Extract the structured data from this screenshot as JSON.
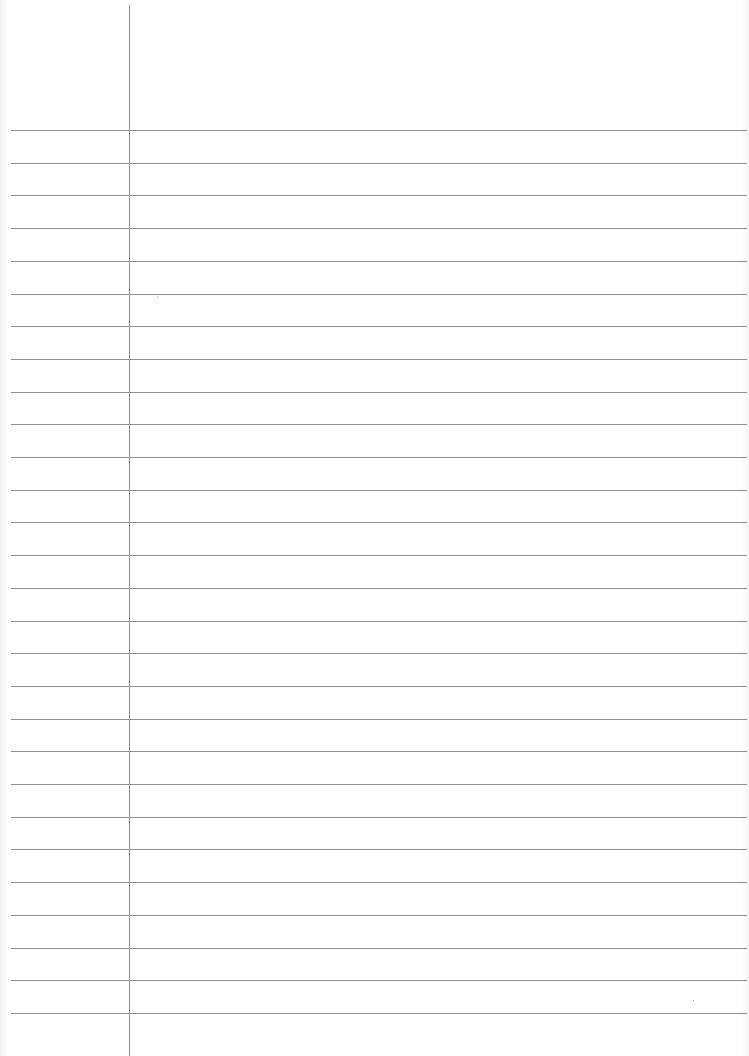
{
  "page": {
    "type": "ruled notebook sheet",
    "text": "",
    "colors": {
      "paper": "#ffffff",
      "rule": "#8f8f8f",
      "margin": "#8a8a8a"
    },
    "margin_line_x": 129,
    "rule_count": 28,
    "first_rule_y": 130,
    "rule_spacing": 32.7
  }
}
